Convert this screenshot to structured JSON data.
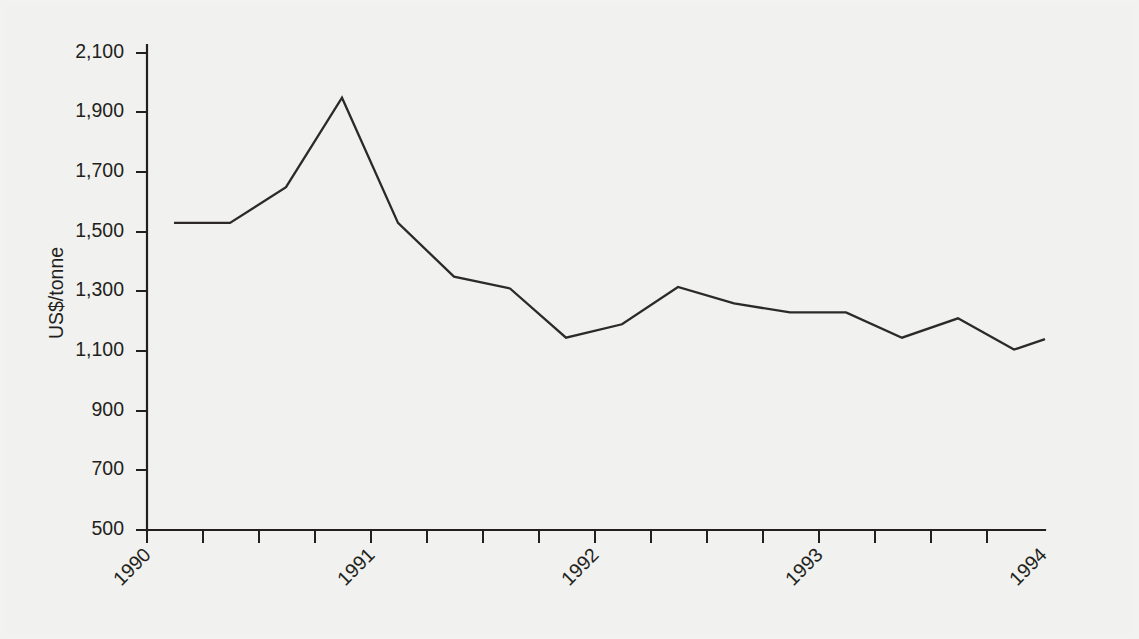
{
  "chart_data": {
    "type": "line",
    "title": "",
    "subtitle": "",
    "xlabel": "",
    "ylabel": "US$/tonne",
    "ylim": [
      500,
      2100
    ],
    "ytick_labels": [
      "2,100",
      "1,900",
      "1,700",
      "1,500",
      "1,300",
      "1,100",
      "900",
      "700",
      "500"
    ],
    "ytick_values": [
      2100,
      1900,
      1700,
      1500,
      1300,
      1100,
      900,
      700,
      500
    ],
    "xtick_labels": [
      "1990",
      "1991",
      "1992",
      "1993",
      "1994"
    ],
    "xtick_values": [
      1990,
      1991,
      1992,
      1993,
      1994
    ],
    "xtick_rotation_degrees": -45,
    "x_minor_ticks_per_year": 4,
    "grid": false,
    "legend": false,
    "legend_position": "none",
    "line_color": "#2c2a29",
    "background_color": "#f1f1ef",
    "x_period": "quarterly",
    "x": [
      "1990 Q1",
      "1990 Q2",
      "1990 Q3",
      "1990 Q4",
      "1991 Q1",
      "1991 Q2",
      "1991 Q3",
      "1991 Q4",
      "1992 Q1",
      "1992 Q2",
      "1992 Q3",
      "1992 Q4",
      "1993 Q1",
      "1993 Q2",
      "1993 Q3",
      "1993 Q4",
      "1994 Q1"
    ],
    "values": [
      1530,
      1530,
      1650,
      1950,
      1530,
      1350,
      1310,
      1145,
      1190,
      1315,
      1260,
      1230,
      1230,
      1145,
      1210,
      1105,
      1140
    ],
    "series": [
      {
        "name": "US$/tonne",
        "values": [
          1530,
          1530,
          1650,
          1950,
          1530,
          1350,
          1310,
          1145,
          1190,
          1315,
          1260,
          1230,
          1230,
          1145,
          1210,
          1105,
          1140
        ]
      }
    ],
    "annotations": []
  }
}
